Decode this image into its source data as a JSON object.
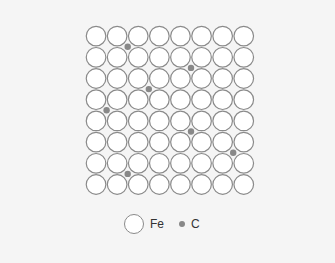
{
  "diagram": {
    "type": "crystal-lattice",
    "grid": {
      "rows": 8,
      "cols": 8
    },
    "origin": {
      "x": 85.5,
      "y": 25.5
    },
    "cell": {
      "w": 21.1,
      "h": 21.2
    },
    "atom_radius": 9.8,
    "colors": {
      "background": "#f5f5f5",
      "fe_fill": "#ffffff",
      "fe_stroke": "#8a8a8a",
      "c_fill": "#888888"
    },
    "carbon_interstitials": [
      {
        "i": 2,
        "j": 1
      },
      {
        "i": 5,
        "j": 2
      },
      {
        "i": 3,
        "j": 3
      },
      {
        "i": 1,
        "j": 4
      },
      {
        "i": 5,
        "j": 5
      },
      {
        "i": 7,
        "j": 6
      },
      {
        "i": 2,
        "j": 7
      }
    ]
  },
  "legend": {
    "items": [
      {
        "symbol": "large-circle",
        "label": "Fe"
      },
      {
        "symbol": "small-dot",
        "label": "C"
      }
    ]
  }
}
